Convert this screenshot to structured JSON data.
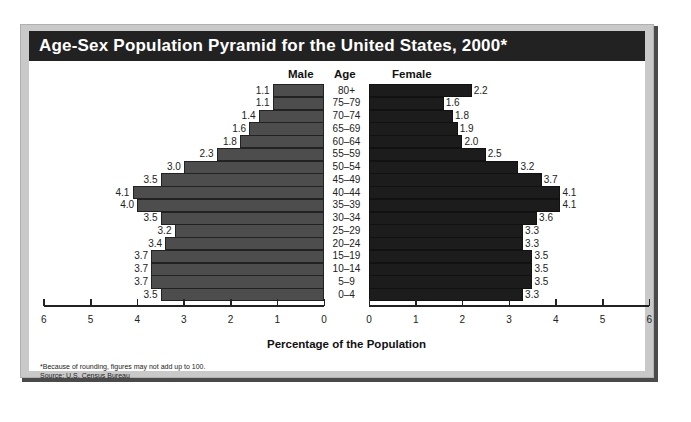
{
  "chart_data": {
    "type": "bar",
    "subtype": "population-pyramid",
    "title": "Age-Sex Population Pyramid for the United States, 2000*",
    "categories": [
      "80+",
      "75–79",
      "70–74",
      "65–69",
      "60–64",
      "55–59",
      "50–54",
      "45–49",
      "40–44",
      "35–39",
      "30–34",
      "25–29",
      "20–24",
      "15–19",
      "10–14",
      "5–9",
      "0–4"
    ],
    "series": [
      {
        "name": "Male",
        "values": [
          1.1,
          1.1,
          1.4,
          1.6,
          1.8,
          2.3,
          3.0,
          3.5,
          4.1,
          4.0,
          3.5,
          3.2,
          3.4,
          3.7,
          3.7,
          3.7,
          3.5
        ],
        "color": "#4d4d4d"
      },
      {
        "name": "Female",
        "values": [
          2.2,
          1.6,
          1.8,
          1.9,
          2.0,
          2.5,
          3.2,
          3.7,
          4.1,
          4.1,
          3.6,
          3.3,
          3.3,
          3.5,
          3.5,
          3.5,
          3.3
        ],
        "color": "#1c1c1c"
      }
    ],
    "male_value_labels": [
      "1.1",
      "1.1",
      "1.4",
      "1.6",
      "1.8",
      "2.3",
      "3.0",
      "3.5",
      "4.1",
      "4.0",
      "3.5",
      "3.2",
      "3.4",
      "3.7",
      "3.7",
      "3.7",
      "3.5"
    ],
    "female_value_labels": [
      "2.2",
      "1.6",
      "1.8",
      "1.9",
      "2.0",
      "2.5",
      "3.2",
      "3.7",
      "4.1",
      "4.1",
      "3.6",
      "3.3",
      "3.3",
      "3.5",
      "3.5",
      "3.5",
      "3.3"
    ],
    "column_headers": {
      "male": "Male",
      "age": "Age",
      "female": "Female"
    },
    "xlabel": "Percentage of the Population",
    "ylabel": "Age",
    "male_ticks": [
      "6",
      "5",
      "4",
      "3",
      "2",
      "1",
      "0"
    ],
    "female_ticks": [
      "0",
      "1",
      "2",
      "3",
      "4",
      "5",
      "6"
    ],
    "xlim": [
      0,
      6
    ],
    "grid": false,
    "legend": "none"
  },
  "footnote": "*Because of rounding, figures may not add up to 100.",
  "source": "Source: U.S. Census Bureau"
}
